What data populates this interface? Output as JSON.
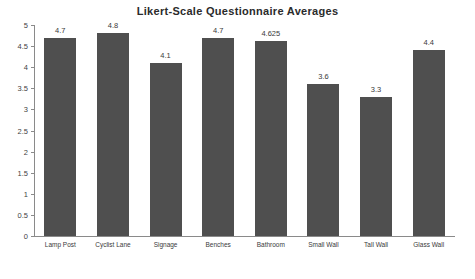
{
  "chart_data": {
    "type": "bar",
    "title": "Likert-Scale Questionnaire  Averages",
    "xlabel": "",
    "ylabel": "",
    "ylim": [
      0,
      5
    ],
    "yticks": [
      "0",
      "0.5",
      "1",
      "1.5",
      "2",
      "2.5",
      "3",
      "3.5",
      "4",
      "4.5",
      "5"
    ],
    "grid": false,
    "legend": null,
    "categories": [
      "Lamp Post",
      "Cyclist Lane",
      "Signage",
      "Benches",
      "Bathroom",
      "Small Wall",
      "Tall Wall",
      "Glass Wall"
    ],
    "values": [
      4.7,
      4.8,
      4.1,
      4.7,
      4.625,
      3.6,
      3.3,
      4.4
    ],
    "value_labels": [
      "4.7",
      "4.8",
      "4.1",
      "4.7",
      "4.625",
      "3.6",
      "3.3",
      "4.4"
    ],
    "bar_color": "#4f4f4f"
  }
}
